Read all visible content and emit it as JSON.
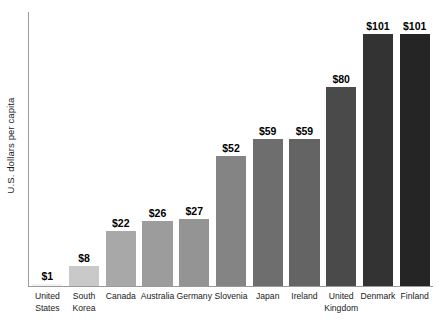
{
  "chart_data": {
    "type": "bar",
    "title": "",
    "subtitle": "",
    "xlabel": "",
    "ylabel": "U.S. dollars per capita",
    "ylim": [
      0,
      110
    ],
    "grid": false,
    "legend": "none",
    "value_prefix": "$",
    "categories": [
      "United States",
      "South Korea",
      "Canada",
      "Australia",
      "Germany",
      "Slovenia",
      "Japan",
      "Ireland",
      "United Kingdom",
      "Denmark",
      "Finland"
    ],
    "category_lines": [
      [
        "United",
        "States"
      ],
      [
        "South",
        "Korea"
      ],
      [
        "Canada"
      ],
      [
        "Australia"
      ],
      [
        "Germany"
      ],
      [
        "Slovenia"
      ],
      [
        "Japan"
      ],
      [
        "Ireland"
      ],
      [
        "United",
        "Kingdom"
      ],
      [
        "Denmark"
      ],
      [
        "Finland"
      ]
    ],
    "values": [
      1,
      8,
      22,
      26,
      27,
      52,
      59,
      59,
      80,
      101,
      101
    ],
    "value_labels": [
      "$1",
      "$8",
      "$22",
      "$26",
      "$27",
      "$52",
      "$59",
      "$59",
      "$80",
      "$101",
      "$101"
    ],
    "bar_colors": [
      "#f2f2f2",
      "#c9c9c9",
      "#a8a8a8",
      "#9c9c9c",
      "#949494",
      "#848484",
      "#6e6e6e",
      "#646464",
      "#4a4a4a",
      "#333333",
      "#252525"
    ],
    "axis_color": "#9a9a9a",
    "label_color": "#1a1a1a",
    "background_color": "#ffffff"
  }
}
